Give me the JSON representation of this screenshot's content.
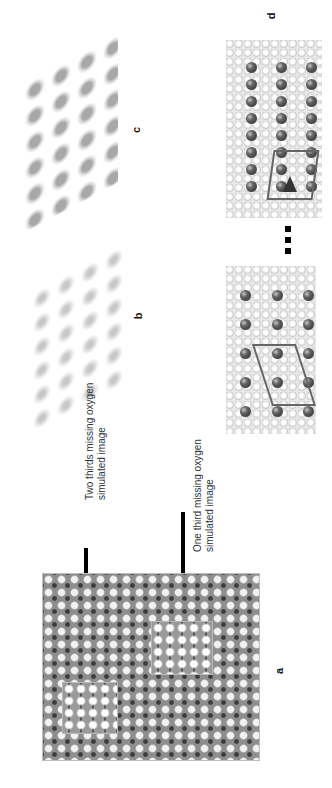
{
  "figure": {
    "orientation": "rotated 90 degrees (text reads bottom-to-top)",
    "panels": [
      {
        "id": "a",
        "label": "a",
        "description": "simulated HRTEM image with two rectangular defect regions"
      },
      {
        "id": "b",
        "label": "b",
        "description": "3D electron density map (light)"
      },
      {
        "id": "c",
        "label": "c",
        "description": "3D electron density map (dark)"
      },
      {
        "id": "d",
        "label": "d",
        "description": "atomic structure models with unit cell outlines, separated by dotted line"
      }
    ],
    "annotations": [
      {
        "id": "two-thirds",
        "line1": "Two thirds missing oxygen",
        "line2": "simulated image"
      },
      {
        "id": "one-third",
        "line1": "One third missing oxygen",
        "line2": "simulated image"
      }
    ],
    "colors": {
      "background": "#ffffff",
      "arrow": "#000000",
      "hrtem_base": "#8e8e8e",
      "atom_dark": "#5a5a5a",
      "atom_light": "#e9e9e9",
      "cell_outline": "#666666"
    }
  }
}
